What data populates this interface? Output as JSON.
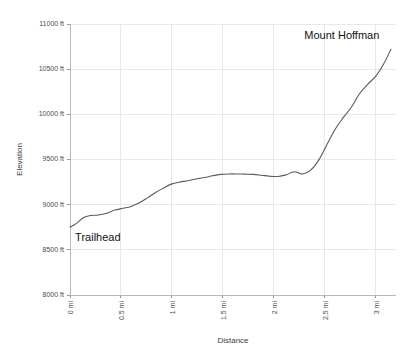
{
  "chart_data": {
    "type": "line",
    "title": "",
    "xlabel": "Distance",
    "ylabel": "Elevation",
    "xlim": [
      0,
      3.2
    ],
    "ylim": [
      8000,
      11000
    ],
    "grid": true,
    "legend_position": "none",
    "x_tick_labels": [
      "0 mi",
      "0.5 mi",
      "1 mi",
      "1.5 mi",
      "2 mi",
      "2.5 mi",
      "3 mi"
    ],
    "x_tick_values": [
      0,
      0.5,
      1,
      1.5,
      2,
      2.5,
      3
    ],
    "y_tick_labels": [
      "8000 ft",
      "8500 ft",
      "9000 ft",
      "9500 ft",
      "10000 ft",
      "10500 ft",
      "11000 ft"
    ],
    "y_tick_values": [
      8000,
      8500,
      9000,
      9500,
      10000,
      10500,
      11000
    ],
    "series": [
      {
        "name": "Mount Hoffman trail elevation",
        "x": [
          0.0,
          0.06,
          0.13,
          0.2,
          0.28,
          0.36,
          0.44,
          0.52,
          0.6,
          0.68,
          0.76,
          0.84,
          0.92,
          1.0,
          1.08,
          1.16,
          1.24,
          1.32,
          1.4,
          1.48,
          1.56,
          1.64,
          1.72,
          1.8,
          1.88,
          1.96,
          2.04,
          2.12,
          2.2,
          2.28,
          2.36,
          2.44,
          2.52,
          2.6,
          2.68,
          2.76,
          2.84,
          2.92,
          3.0,
          3.08,
          3.15
        ],
        "y": [
          8750,
          8790,
          8855,
          8880,
          8885,
          8905,
          8940,
          8960,
          8980,
          9020,
          9075,
          9135,
          9185,
          9230,
          9250,
          9265,
          9285,
          9300,
          9320,
          9335,
          9340,
          9340,
          9338,
          9335,
          9325,
          9315,
          9312,
          9330,
          9365,
          9340,
          9380,
          9490,
          9660,
          9830,
          9960,
          10075,
          10225,
          10330,
          10420,
          10560,
          10720
        ]
      }
    ],
    "annotations": [
      {
        "text": "Trailhead",
        "x": 0.05,
        "y": 8600,
        "anchor": "start"
      },
      {
        "text": "Mount Hoffman",
        "x": 2.3,
        "y": 10830,
        "anchor": "start"
      }
    ]
  }
}
